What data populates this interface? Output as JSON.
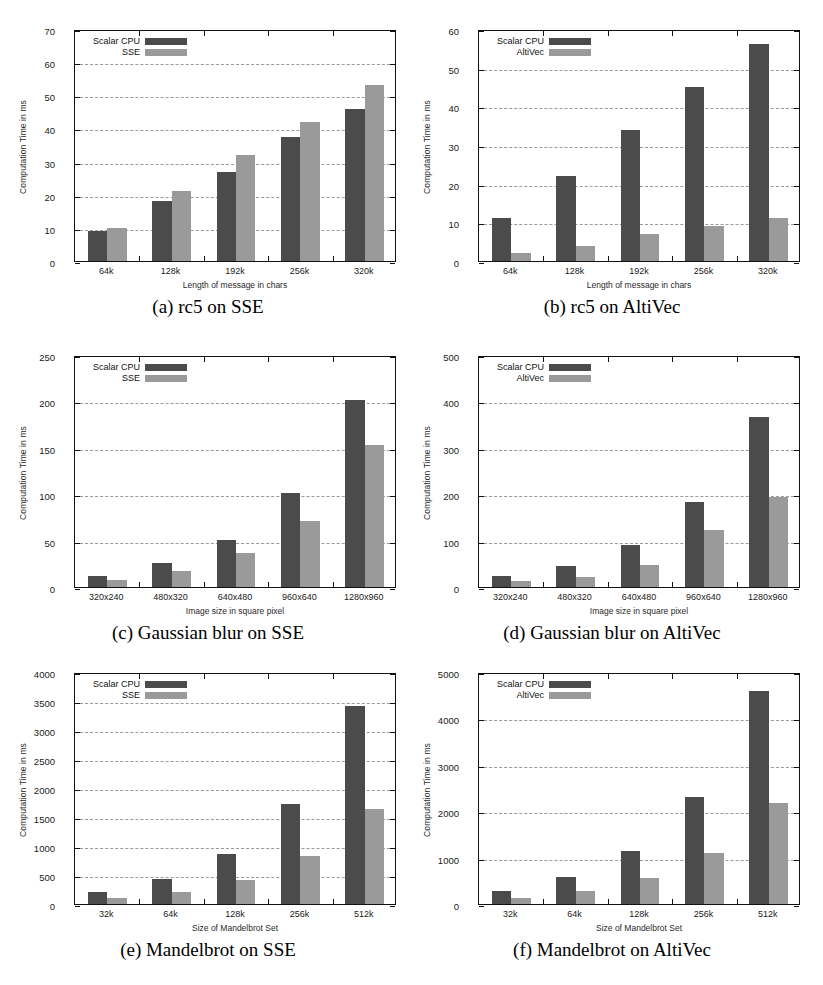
{
  "figure": {
    "series_colors": {
      "scalar": "#4b4b4b",
      "simd": "#9a9a9a"
    },
    "panels": [
      {
        "id": "a",
        "caption": "(a) rc5 on SSE",
        "chart_data": {
          "type": "bar",
          "title": "",
          "xlabel": "Length of message in chars",
          "ylabel": "Computation Time in ms",
          "categories": [
            "64k",
            "128k",
            "192k",
            "256k",
            "320k"
          ],
          "ylim": [
            0,
            70
          ],
          "yticks": [
            0,
            10,
            20,
            30,
            40,
            50,
            60,
            70
          ],
          "grid": true,
          "legend_position": "top-left",
          "series": [
            {
              "name": "Scalar CPU",
              "values": [
                9,
                18,
                27,
                37.5,
                46
              ]
            },
            {
              "name": "SSE",
              "values": [
                10,
                21,
                32,
                42,
                53
              ]
            }
          ]
        }
      },
      {
        "id": "b",
        "caption": "(b) rc5 on AltiVec",
        "chart_data": {
          "type": "bar",
          "title": "",
          "xlabel": "Length of message in chars",
          "ylabel": "Computation Time in ms",
          "categories": [
            "64k",
            "128k",
            "192k",
            "256k",
            "320k"
          ],
          "ylim": [
            0,
            60
          ],
          "yticks": [
            0,
            10,
            20,
            30,
            40,
            50,
            60
          ],
          "grid": true,
          "legend_position": "top-left",
          "series": [
            {
              "name": "Scalar CPU",
              "values": [
                11,
                22,
                34,
                45,
                56
              ]
            },
            {
              "name": "AltiVec",
              "values": [
                2,
                4,
                7,
                9,
                11.2
              ]
            }
          ]
        }
      },
      {
        "id": "c",
        "caption": "(c) Gaussian blur on SSE",
        "chart_data": {
          "type": "bar",
          "title": "",
          "xlabel": "Image size in square pixel",
          "ylabel": "Computation Time in ms",
          "categories": [
            "320x240",
            "480x320",
            "640x480",
            "960x640",
            "1280x960"
          ],
          "ylim": [
            0,
            250
          ],
          "yticks": [
            0,
            50,
            100,
            150,
            200,
            250
          ],
          "grid": true,
          "legend_position": "top-left",
          "series": [
            {
              "name": "Scalar CPU",
              "values": [
                12,
                26,
                51,
                101,
                201
              ]
            },
            {
              "name": "SSE",
              "values": [
                8,
                17,
                37,
                71,
                153
              ]
            }
          ]
        }
      },
      {
        "id": "d",
        "caption": "(d) Gaussian blur on AltiVec",
        "chart_data": {
          "type": "bar",
          "title": "",
          "xlabel": "Image size in square pixel",
          "ylabel": "Computation Time in ms",
          "categories": [
            "320x240",
            "480x320",
            "640x480",
            "960x640",
            "1280x960"
          ],
          "ylim": [
            0,
            500
          ],
          "yticks": [
            0,
            100,
            200,
            300,
            400,
            500
          ],
          "grid": true,
          "legend_position": "top-left",
          "series": [
            {
              "name": "Scalar CPU",
              "values": [
                24,
                46,
                91,
                183,
                367
              ]
            },
            {
              "name": "AltiVec",
              "values": [
                13,
                22,
                47,
                123,
                195
              ]
            }
          ]
        }
      },
      {
        "id": "e",
        "caption": "(e) Mandelbrot on SSE",
        "chart_data": {
          "type": "bar",
          "title": "",
          "xlabel": "Size of Mandelbrot Set",
          "ylabel": "Computation Time in ms",
          "categories": [
            "32k",
            "64k",
            "128k",
            "256k",
            "512k"
          ],
          "ylim": [
            0,
            4000
          ],
          "yticks": [
            0,
            500,
            1000,
            1500,
            2000,
            2500,
            3000,
            3500,
            4000
          ],
          "grid": true,
          "legend_position": "top-left",
          "series": [
            {
              "name": "Scalar CPU",
              "values": [
                215,
                425,
                865,
                1720,
                3420
              ]
            },
            {
              "name": "SSE",
              "values": [
                100,
                210,
                420,
                830,
                1630
              ]
            }
          ]
        }
      },
      {
        "id": "f",
        "caption": "(f) Mandelbrot on AltiVec",
        "chart_data": {
          "type": "bar",
          "title": "",
          "xlabel": "Size of Mandelbrot Set",
          "ylabel": "Computation Time in ms",
          "categories": [
            "32k",
            "64k",
            "128k",
            "256k",
            "512k"
          ],
          "ylim": [
            0,
            5000
          ],
          "yticks": [
            0,
            1000,
            2000,
            3000,
            4000,
            5000
          ],
          "grid": true,
          "legend_position": "top-left",
          "series": [
            {
              "name": "Scalar CPU",
              "values": [
                270,
                580,
                1150,
                2300,
                4600
              ]
            },
            {
              "name": "AltiVec",
              "values": [
                140,
                270,
                560,
                1090,
                2170
              ]
            }
          ]
        }
      }
    ]
  }
}
